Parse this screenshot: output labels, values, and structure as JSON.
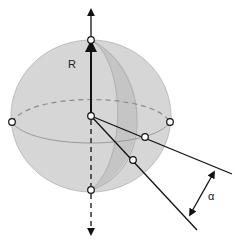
{
  "diagram": {
    "type": "sphere-geometry",
    "labels": {
      "radius": "R",
      "angle": "α"
    },
    "colors": {
      "sphere_fill": "#d4d4d4",
      "sphere_stroke": "#b8b8b8",
      "lune_fill": "#c4c4c4",
      "line": "#111111",
      "point_fill": "#ffffff"
    },
    "points": [
      {
        "name": "north-pole",
        "x": 91,
        "y": 40
      },
      {
        "name": "south-pole",
        "x": 91,
        "y": 190
      },
      {
        "name": "equator-left",
        "x": 12,
        "y": 122
      },
      {
        "name": "equator-right",
        "x": 170,
        "y": 122
      },
      {
        "name": "center",
        "x": 91,
        "y": 116
      },
      {
        "name": "ray1-surface",
        "x": 145,
        "y": 137
      },
      {
        "name": "ray2-surface",
        "x": 133,
        "y": 160
      }
    ]
  }
}
